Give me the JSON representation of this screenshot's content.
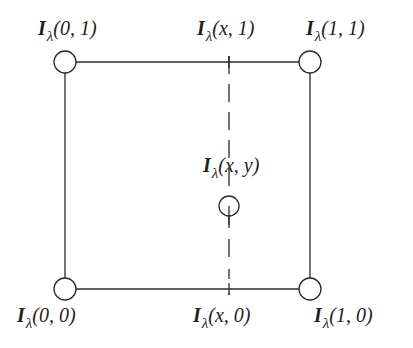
{
  "diagram": {
    "type": "bilinear-interpolation-square",
    "colors": {
      "stroke": "#2a2a2a",
      "text": "#1e1e1e",
      "background": "#ffffff"
    },
    "corners": [
      {
        "id": "top-left",
        "symbol": "I",
        "subscript": "λ",
        "args": "(0, 1)"
      },
      {
        "id": "top-right",
        "symbol": "I",
        "subscript": "λ",
        "args": "(1, 1)"
      },
      {
        "id": "bottom-left",
        "symbol": "I",
        "subscript": "λ",
        "args": "(0, 0)"
      },
      {
        "id": "bottom-right",
        "symbol": "I",
        "subscript": "λ",
        "args": "(1, 0)"
      }
    ],
    "edge_points": [
      {
        "id": "top-mid",
        "symbol": "I",
        "subscript": "λ",
        "args": "(x, 1)"
      },
      {
        "id": "bottom-mid",
        "symbol": "I",
        "subscript": "λ",
        "args": "(x, 0)"
      }
    ],
    "center_point": {
      "id": "interior",
      "symbol": "I",
      "subscript": "λ",
      "args": "(x, y)"
    }
  }
}
